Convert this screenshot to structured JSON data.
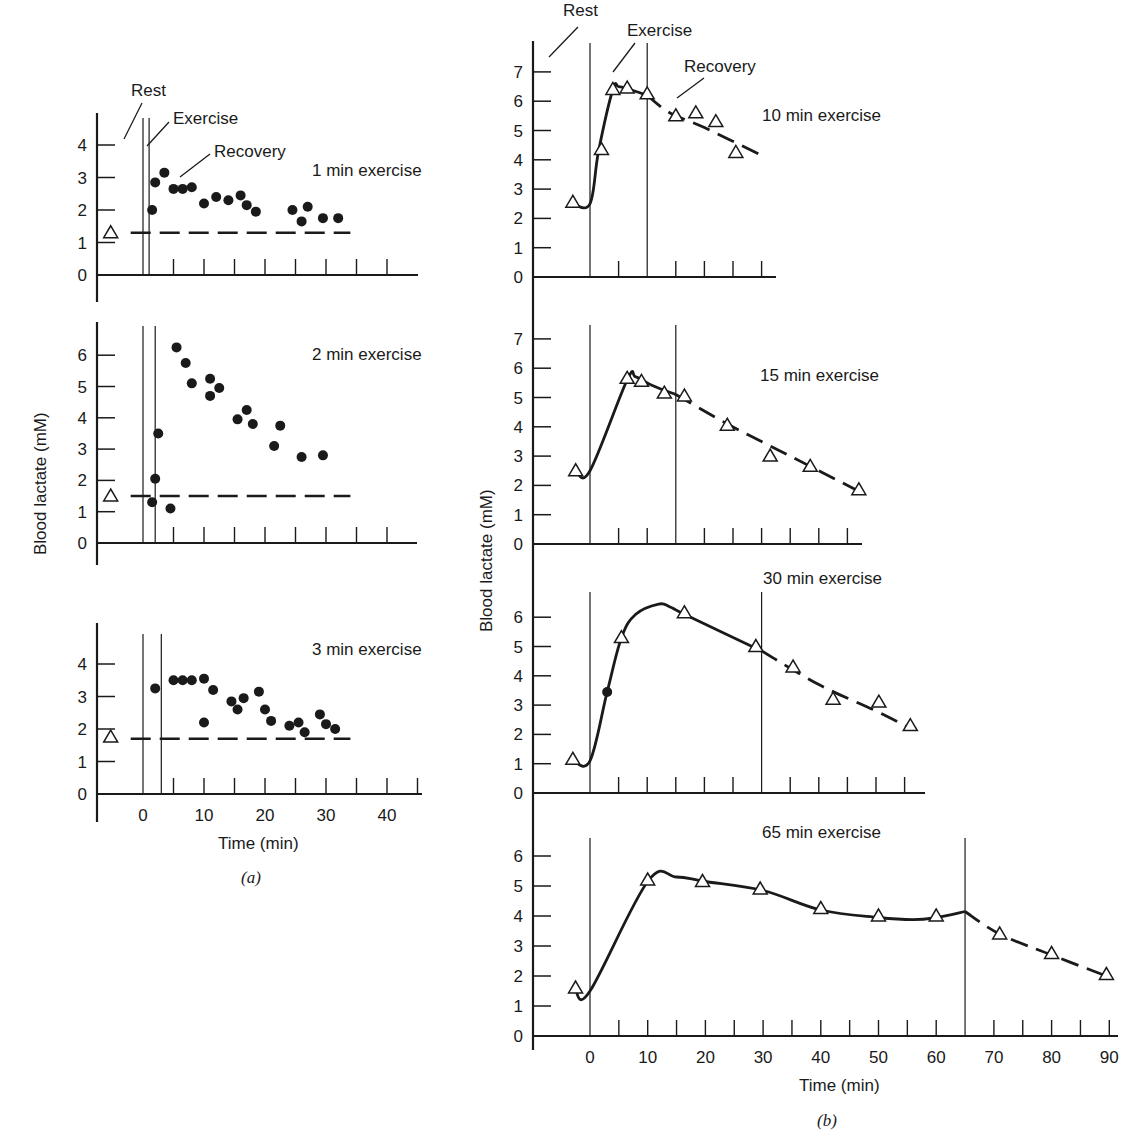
{
  "figure": {
    "ylabel": "Blood lactate (mM)",
    "xlabel": "Time (min)",
    "part_a_label": "(a)",
    "part_b_label": "(b)",
    "annotations": {
      "rest": "Rest",
      "exercise": "Exercise",
      "recovery": "Recovery"
    },
    "colors": {
      "ink": "#1a1a1a",
      "background": "#ffffff"
    }
  },
  "chart_data": [
    {
      "type": "scatter",
      "panel": "a1",
      "title": "1 min exercise",
      "xlabel": "Time (min)",
      "ylabel": "Blood lactate (mM)",
      "xlim": [
        -8,
        45
      ],
      "ylim": [
        0,
        4.5
      ],
      "yticks": [
        0,
        1,
        2,
        3,
        4
      ],
      "exercise_interval": [
        0,
        1
      ],
      "rest_value": {
        "x": -3,
        "y": 1.3,
        "marker": "open-triangle"
      },
      "baseline_dashed": 1.3,
      "points": [
        [
          1.5,
          2.0
        ],
        [
          2,
          2.85
        ],
        [
          3.5,
          3.15
        ],
        [
          5,
          2.65
        ],
        [
          6.5,
          2.65
        ],
        [
          8,
          2.7
        ],
        [
          10,
          2.2
        ],
        [
          12,
          2.4
        ],
        [
          14,
          2.3
        ],
        [
          16,
          2.45
        ],
        [
          17,
          2.15
        ],
        [
          18.5,
          1.95
        ],
        [
          24.5,
          2.0
        ],
        [
          26,
          1.65
        ],
        [
          27,
          2.1
        ],
        [
          29.5,
          1.75
        ],
        [
          32,
          1.75
        ]
      ]
    },
    {
      "type": "scatter",
      "panel": "a2",
      "title": "2 min exercise",
      "xlabel": "Time (min)",
      "ylabel": "Blood lactate (mM)",
      "xlim": [
        -8,
        45
      ],
      "ylim": [
        0,
        7
      ],
      "yticks": [
        0,
        1,
        2,
        3,
        4,
        5,
        6
      ],
      "exercise_interval": [
        0,
        2
      ],
      "rest_value": {
        "x": -3,
        "y": 1.5,
        "marker": "open-triangle"
      },
      "baseline_dashed": 1.5,
      "points": [
        [
          1.5,
          1.3
        ],
        [
          2,
          2.05
        ],
        [
          2.5,
          3.5
        ],
        [
          4.5,
          1.1
        ],
        [
          5.5,
          6.25
        ],
        [
          7,
          5.75
        ],
        [
          8,
          5.1
        ],
        [
          11,
          5.25
        ],
        [
          11,
          4.7
        ],
        [
          12.5,
          4.95
        ],
        [
          15.5,
          3.95
        ],
        [
          17,
          4.25
        ],
        [
          18,
          3.8
        ],
        [
          21.5,
          3.1
        ],
        [
          22.5,
          3.75
        ],
        [
          26,
          2.75
        ],
        [
          29.5,
          2.8
        ]
      ]
    },
    {
      "type": "scatter",
      "panel": "a3",
      "title": "3 min exercise",
      "xlabel": "Time (min)",
      "ylabel": "Blood lactate (mM)",
      "xlim": [
        -8,
        45
      ],
      "ylim": [
        0,
        4.8
      ],
      "xticks": [
        0,
        10,
        20,
        30,
        40
      ],
      "yticks": [
        0,
        1,
        2,
        3,
        4
      ],
      "exercise_interval": [
        0,
        3
      ],
      "rest_value": {
        "x": -3,
        "y": 1.75,
        "marker": "open-triangle"
      },
      "baseline_dashed": 1.7,
      "points": [
        [
          2,
          3.25
        ],
        [
          5,
          3.5
        ],
        [
          6.5,
          3.5
        ],
        [
          8,
          3.5
        ],
        [
          10,
          2.2
        ],
        [
          10,
          3.55
        ],
        [
          11.5,
          3.2
        ],
        [
          14.5,
          2.85
        ],
        [
          15.5,
          2.6
        ],
        [
          16.5,
          2.95
        ],
        [
          19,
          3.15
        ],
        [
          20,
          2.6
        ],
        [
          21,
          2.25
        ],
        [
          24,
          2.1
        ],
        [
          25.5,
          2.2
        ],
        [
          26.5,
          1.9
        ],
        [
          29,
          2.45
        ],
        [
          30,
          2.15
        ],
        [
          31.5,
          2.0
        ]
      ]
    },
    {
      "type": "line",
      "panel": "b1",
      "title": "10 min exercise",
      "xlabel": "Time (min)",
      "ylabel": "Blood lactate (mM)",
      "xlim": [
        -10,
        30
      ],
      "ylim": [
        0,
        7.5
      ],
      "yticks": [
        0,
        1,
        2,
        3,
        4,
        5,
        6,
        7
      ],
      "exercise_interval": [
        0,
        10
      ],
      "points": [
        [
          -3,
          2.55
        ],
        [
          2,
          4.35
        ],
        [
          4,
          6.4
        ],
        [
          6.5,
          6.45
        ],
        [
          10,
          6.25
        ],
        [
          15,
          5.5
        ],
        [
          18.5,
          5.6
        ],
        [
          22,
          5.3
        ],
        [
          25.5,
          4.25
        ]
      ],
      "solid_curve": [
        [
          -3,
          2.5
        ],
        [
          0,
          2.5
        ],
        [
          1.5,
          4.3
        ],
        [
          4,
          6.4
        ],
        [
          5,
          6.5
        ],
        [
          7,
          6.4
        ],
        [
          10,
          6.2
        ]
      ],
      "dashed_curve": [
        [
          10,
          6.2
        ],
        [
          14,
          5.6
        ],
        [
          20,
          5.1
        ],
        [
          30,
          4.15
        ]
      ]
    },
    {
      "type": "line",
      "panel": "b2",
      "title": "15 min exercise",
      "xlabel": "Time (min)",
      "ylabel": "Blood lactate (mM)",
      "xlim": [
        -10,
        50
      ],
      "ylim": [
        0,
        7.5
      ],
      "yticks": [
        0,
        1,
        2,
        3,
        4,
        5,
        6,
        7
      ],
      "exercise_interval": [
        0,
        15
      ],
      "points": [
        [
          -2.5,
          2.5
        ],
        [
          6.5,
          5.65
        ],
        [
          9,
          5.55
        ],
        [
          13,
          5.15
        ],
        [
          16.5,
          5.05
        ],
        [
          24,
          4.05
        ],
        [
          31.5,
          3.0
        ],
        [
          38.5,
          2.65
        ],
        [
          47,
          1.85
        ]
      ],
      "solid_curve": [
        [
          -2.5,
          2.5
        ],
        [
          0,
          2.5
        ],
        [
          6.5,
          5.6
        ],
        [
          8,
          5.7
        ],
        [
          11,
          5.4
        ],
        [
          15,
          5.1
        ]
      ],
      "dashed_curve": [
        [
          15,
          5.1
        ],
        [
          24,
          4.1
        ],
        [
          35,
          3.0
        ],
        [
          47,
          1.8
        ]
      ]
    },
    {
      "type": "line",
      "panel": "b3",
      "title": "30 min exercise",
      "xlabel": "Time (min)",
      "ylabel": "Blood lactate (mM)",
      "xlim": [
        -10,
        60
      ],
      "ylim": [
        0,
        7
      ],
      "yticks": [
        0,
        1,
        2,
        3,
        4,
        5,
        6
      ],
      "exercise_interval": [
        0,
        30
      ],
      "points": [
        [
          -3,
          1.15
        ],
        [
          3,
          3.45
        ],
        [
          5.5,
          5.3
        ],
        [
          16.5,
          6.15
        ],
        [
          29,
          5.0
        ],
        [
          35.5,
          4.3
        ],
        [
          42.5,
          3.2
        ],
        [
          50.5,
          3.1
        ],
        [
          56,
          2.3
        ]
      ],
      "solid_curve": [
        [
          -3,
          1.1
        ],
        [
          0,
          1.1
        ],
        [
          3,
          3.45
        ],
        [
          5.5,
          5.3
        ],
        [
          8,
          6.1
        ],
        [
          12,
          6.45
        ],
        [
          14,
          6.35
        ],
        [
          16.5,
          6.1
        ],
        [
          30,
          4.85
        ]
      ],
      "dashed_curve": [
        [
          30,
          4.85
        ],
        [
          40,
          3.7
        ],
        [
          50,
          2.8
        ],
        [
          56,
          2.2
        ]
      ],
      "special_points": [
        {
          "x": 3,
          "y": 3.45,
          "marker": "filled-circle"
        }
      ]
    },
    {
      "type": "line",
      "panel": "b4",
      "title": "65 min exercise",
      "xlabel": "Time (min)",
      "ylabel": "Blood lactate (mM)",
      "xlim": [
        -10,
        92
      ],
      "ylim": [
        0,
        7
      ],
      "xticks": [
        0,
        10,
        20,
        30,
        40,
        50,
        60,
        70,
        80,
        90
      ],
      "yticks": [
        0,
        1,
        2,
        3,
        4,
        5,
        6
      ],
      "exercise_interval": [
        0,
        65
      ],
      "points": [
        [
          -2.5,
          1.6
        ],
        [
          10,
          5.2
        ],
        [
          19.5,
          5.15
        ],
        [
          29.5,
          4.9
        ],
        [
          40,
          4.25
        ],
        [
          50,
          4.0
        ],
        [
          60,
          4.0
        ],
        [
          71,
          3.4
        ],
        [
          80,
          2.75
        ],
        [
          89.5,
          2.05
        ]
      ],
      "solid_curve": [
        [
          -2.5,
          1.5
        ],
        [
          0,
          1.5
        ],
        [
          10,
          5.15
        ],
        [
          15,
          5.3
        ],
        [
          20,
          5.15
        ],
        [
          30,
          4.85
        ],
        [
          40,
          4.2
        ],
        [
          50,
          3.95
        ],
        [
          56,
          3.88
        ],
        [
          60,
          3.95
        ],
        [
          65,
          4.15
        ]
      ],
      "dashed_curve": [
        [
          65,
          4.15
        ],
        [
          71,
          3.4
        ],
        [
          80,
          2.7
        ],
        [
          89.5,
          2.0
        ]
      ]
    }
  ]
}
